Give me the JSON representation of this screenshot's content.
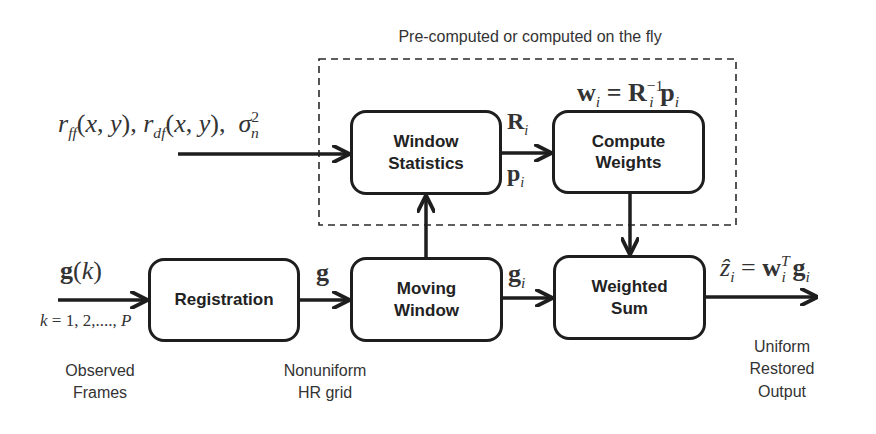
{
  "title": "Pre-computed or computed on the fly",
  "blocks": {
    "window_statistics": [
      "Window",
      "Statistics"
    ],
    "compute_weights": [
      "Compute",
      "Weights"
    ],
    "registration": [
      "Registration"
    ],
    "moving_window": [
      "Moving",
      "Window"
    ],
    "weighted_sum": [
      "Weighted",
      "Sum"
    ]
  },
  "inputs": {
    "stats_input": "r_ff(x, y), r_df(x, y), σ_n^2",
    "frames_input": "g(k)",
    "frames_index": "k = 1, 2, ..., P"
  },
  "edge_labels": {
    "R": "R_i",
    "p": "p_i",
    "weights_eq": "w_i = R_i^-1 p_i",
    "g": "g",
    "g_i": "g_i",
    "output_eq": "ẑ_i = w_i^T g_i"
  },
  "captions": {
    "observed": [
      "Observed",
      "Frames"
    ],
    "nonuniform": [
      "Nonuniform",
      "HR grid"
    ],
    "uniform": [
      "Uniform",
      "Restored",
      "Output"
    ]
  },
  "colors": {
    "stroke": "#1e1e1e",
    "text": "#333333",
    "background": "#ffffff"
  }
}
